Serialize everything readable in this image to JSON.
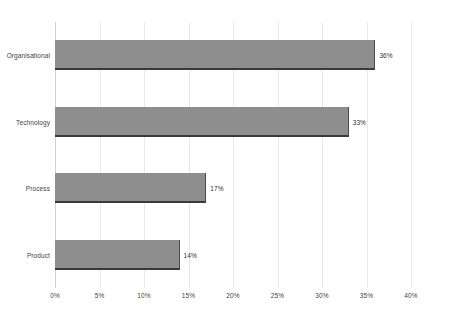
{
  "chart_data": {
    "type": "bar",
    "orientation": "horizontal",
    "title": "",
    "subtitle": "",
    "xlabel": "",
    "ylabel": "",
    "categories": [
      "Organisational",
      "Technology",
      "Process",
      "Product"
    ],
    "values": [
      36,
      33,
      17,
      14
    ],
    "value_labels": [
      "36%",
      "33%",
      "17%",
      "14%"
    ],
    "xlim": [
      0,
      40
    ],
    "xtick_values": [
      0,
      5,
      10,
      15,
      20,
      25,
      30,
      35,
      40
    ],
    "xtick_labels": [
      "0%",
      "5%",
      "10%",
      "15%",
      "20%",
      "25%",
      "30%",
      "35%",
      "40%"
    ],
    "grid": true,
    "grid_axis": "x",
    "legend": false,
    "legend_position": "none",
    "colors": {
      "bar_fill": "#8e8e8e",
      "bar_shadow": "#3a3a3a",
      "gridline": "#e9e9e9",
      "axis": "#d2d2d2",
      "text": "#3f3f3f",
      "background": "#ffffff"
    }
  }
}
